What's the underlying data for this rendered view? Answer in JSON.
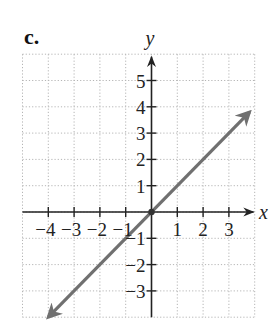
{
  "part_label": "c.",
  "chart_data": {
    "type": "line",
    "title": "",
    "xlabel": "x",
    "ylabel": "y",
    "xlim": [
      -5,
      4
    ],
    "ylim": [
      -4,
      6
    ],
    "grid": true,
    "grid_style": "dotted",
    "x_ticks": [
      -4,
      -3,
      -2,
      -1,
      1,
      2,
      3
    ],
    "x_tick_labels": [
      "−4",
      "−3",
      "−2",
      "−1",
      "1",
      "2",
      "3"
    ],
    "y_ticks": [
      5,
      4,
      3,
      2,
      1,
      -1,
      -2,
      -3
    ],
    "y_tick_labels": [
      "5",
      "4",
      "3",
      "2",
      "1",
      "−1",
      "−2",
      "−3"
    ],
    "series": [
      {
        "name": "y = x",
        "equation": "y = x",
        "color": "#707070",
        "arrows_both_ends": true,
        "points": [
          [
            -4,
            -4
          ],
          [
            0,
            0
          ],
          [
            3.8,
            3.8
          ]
        ],
        "marked_points": [
          [
            0,
            0
          ]
        ]
      }
    ],
    "colors": {
      "axis": "#222222",
      "grid": "#b5b5b5",
      "line": "#707070"
    }
  }
}
